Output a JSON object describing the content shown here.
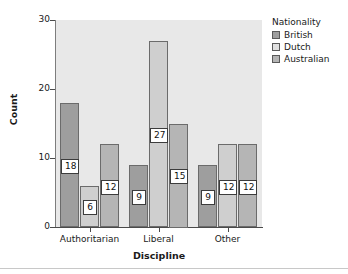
{
  "chart_data": {
    "type": "bar",
    "title": "",
    "subtitle": "",
    "xlabel": "Discipline",
    "ylabel": "Count",
    "categories": [
      "Authoritarian",
      "Liberal",
      "Other"
    ],
    "series": [
      {
        "name": "British",
        "values": [
          18,
          9,
          9
        ],
        "color": "#9e9e9e"
      },
      {
        "name": "Dutch",
        "values": [
          6,
          27,
          12
        ],
        "color": "#cfcfcf"
      },
      {
        "name": "Australian",
        "values": [
          12,
          15,
          12
        ],
        "color": "#b5b5b5"
      }
    ],
    "ylim": [
      0,
      30
    ],
    "yticks": [
      0,
      10,
      20,
      30
    ],
    "ytick_labels": [
      "0",
      "10",
      "20",
      "30"
    ],
    "grid": false,
    "legend_position": "right",
    "legend_title": "Nationality",
    "data_labels_shown": true,
    "data_labels": [
      {
        "category": "Authoritarian",
        "series": "British",
        "value": "18"
      },
      {
        "category": "Authoritarian",
        "series": "Dutch",
        "value": "6"
      },
      {
        "category": "Authoritarian",
        "series": "Australian",
        "value": "12"
      },
      {
        "category": "Liberal",
        "series": "British",
        "value": "9"
      },
      {
        "category": "Liberal",
        "series": "Dutch",
        "value": "27"
      },
      {
        "category": "Liberal",
        "series": "Australian",
        "value": "15"
      },
      {
        "category": "Other",
        "series": "British",
        "value": "9"
      },
      {
        "category": "Other",
        "series": "Dutch",
        "value": "12"
      },
      {
        "category": "Other",
        "series": "Australian",
        "value": "12"
      }
    ],
    "plot_background": "#e8e8e8",
    "figure_background": "#ffffff"
  }
}
